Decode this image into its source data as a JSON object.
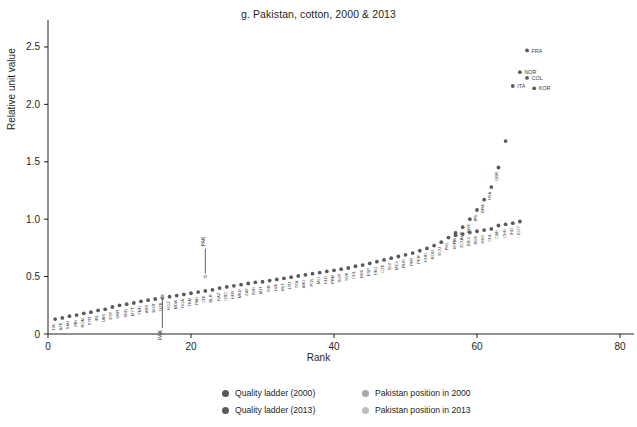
{
  "chart_data": {
    "type": "scatter",
    "title": "g. Pakistan, cotton,  2000 & 2013",
    "xlabel": "Rank",
    "ylabel": "Relative unit value",
    "xlim": [
      0,
      80
    ],
    "ylim": [
      0,
      2.7
    ],
    "xticks": [
      "0",
      "20",
      "40",
      "60",
      "80"
    ],
    "xtick_values": [
      0,
      20,
      40,
      60,
      80
    ],
    "yticks": [
      "0",
      "0.5",
      "1.0",
      "1.5",
      "2.0",
      "2.5"
    ],
    "ytick_values": [
      0,
      0.5,
      1.0,
      1.5,
      2.0,
      2.5
    ],
    "grid": false,
    "legend_position": "bottom-center",
    "series": [
      {
        "name": "Quality ladder (2000)",
        "color": "#5a5a5a",
        "points": [
          {
            "rank": 1,
            "value": 0.13,
            "label": "TJK"
          },
          {
            "rank": 2,
            "value": 0.14,
            "label": "AZE"
          },
          {
            "rank": 3,
            "value": 0.155,
            "label": "SAU"
          },
          {
            "rank": 4,
            "value": 0.165,
            "label": "IRN"
          },
          {
            "rank": 5,
            "value": 0.18,
            "label": "ROM"
          },
          {
            "rank": 6,
            "value": 0.19,
            "label": "SYR"
          },
          {
            "rank": 7,
            "value": 0.205,
            "label": "IRL"
          },
          {
            "rank": 8,
            "value": 0.215,
            "label": "UAS"
          },
          {
            "rank": 9,
            "value": 0.235,
            "label": "EST"
          },
          {
            "rank": 10,
            "value": 0.25,
            "label": "UKR"
          },
          {
            "rank": 11,
            "value": 0.26,
            "label": "SDN"
          },
          {
            "rank": 12,
            "value": 0.27,
            "label": "MYT"
          },
          {
            "rank": 13,
            "value": 0.285,
            "label": "YMN"
          },
          {
            "rank": 14,
            "value": 0.295,
            "label": "ARS"
          },
          {
            "rank": 15,
            "value": 0.305,
            "label": "BGR"
          },
          {
            "rank": 16,
            "value": 0.315,
            "label": "UZB"
          },
          {
            "rank": 17,
            "value": 0.325,
            "label": "KGZ"
          },
          {
            "rank": 18,
            "value": 0.335,
            "label": "MDA"
          },
          {
            "rank": 19,
            "value": 0.345,
            "label": "NGA"
          },
          {
            "rank": 20,
            "value": 0.355,
            "label": "TKM"
          },
          {
            "rank": 21,
            "value": 0.365,
            "label": "PAN"
          },
          {
            "rank": 22,
            "value": 0.375,
            "label": "CRI"
          },
          {
            "rank": 23,
            "value": 0.385,
            "label": "BLR"
          },
          {
            "rank": 24,
            "value": 0.4,
            "label": "KAZ"
          },
          {
            "rank": 25,
            "value": 0.41,
            "label": "GRC"
          },
          {
            "rank": 26,
            "value": 0.42,
            "label": "HRV"
          },
          {
            "rank": 27,
            "value": 0.43,
            "label": "MKD"
          },
          {
            "rank": 28,
            "value": 0.44,
            "label": "ZAF"
          },
          {
            "rank": 29,
            "value": 0.45,
            "label": "SVN"
          },
          {
            "rank": 30,
            "value": 0.455,
            "label": "AUT"
          },
          {
            "rank": 31,
            "value": 0.465,
            "label": "ISR"
          },
          {
            "rank": 32,
            "value": 0.475,
            "label": "LVA"
          },
          {
            "rank": 33,
            "value": 0.485,
            "label": "MLT"
          },
          {
            "rank": 34,
            "value": 0.495,
            "label": "LTU"
          },
          {
            "rank": 35,
            "value": 0.505,
            "label": "TZA"
          },
          {
            "rank": 36,
            "value": 0.515,
            "label": "ARG"
          },
          {
            "rank": 37,
            "value": 0.525,
            "label": "POL"
          },
          {
            "rank": 38,
            "value": 0.535,
            "label": "MLI"
          },
          {
            "rank": 39,
            "value": 0.545,
            "label": "NLD"
          },
          {
            "rank": 40,
            "value": 0.555,
            "label": "PRM"
          },
          {
            "rank": 41,
            "value": 0.565,
            "label": "SGP"
          },
          {
            "rank": 42,
            "value": 0.575,
            "label": "SVK"
          },
          {
            "rank": 43,
            "value": 0.59,
            "label": "CHL"
          },
          {
            "rank": 44,
            "value": 0.6,
            "label": "DNK"
          },
          {
            "rank": 45,
            "value": 0.615,
            "label": "ESP"
          },
          {
            "rank": 46,
            "value": 0.63,
            "label": "HKG"
          },
          {
            "rank": 47,
            "value": 0.645,
            "label": "CZE"
          },
          {
            "rank": 48,
            "value": 0.66,
            "label": "SLV"
          },
          {
            "rank": 49,
            "value": 0.675,
            "label": "MEX"
          },
          {
            "rank": 50,
            "value": 0.69,
            "label": "RUS"
          },
          {
            "rank": 51,
            "value": 0.705,
            "label": "PRT"
          },
          {
            "rank": 52,
            "value": 0.725,
            "label": "PER"
          },
          {
            "rank": 53,
            "value": 0.745,
            "label": "HUN"
          },
          {
            "rank": 54,
            "value": 0.77,
            "label": "ROU"
          },
          {
            "rank": 55,
            "value": 0.8,
            "label": "ECU"
          },
          {
            "rank": 56,
            "value": 0.84,
            "label": "PHL"
          },
          {
            "rank": 57,
            "value": 0.88,
            "label": "FIN"
          },
          {
            "rank": 58,
            "value": 0.93,
            "label": "AUT"
          },
          {
            "rank": 59,
            "value": 1.0,
            "label": "SWE"
          },
          {
            "rank": 60,
            "value": 1.08,
            "label": "JPN"
          },
          {
            "rank": 61,
            "value": 1.17,
            "label": "BRA"
          },
          {
            "rank": 62,
            "value": 1.28,
            "label": "USA"
          },
          {
            "rank": 63,
            "value": 1.45,
            "label": "GBR"
          },
          {
            "rank": 64,
            "value": 1.68,
            "label": ""
          },
          {
            "rank": 65,
            "value": 2.16,
            "label": "ITA"
          },
          {
            "rank": 66,
            "value": 2.28,
            "label": "NOR"
          },
          {
            "rank": 67,
            "value": 2.47,
            "label": "FRA"
          }
        ]
      },
      {
        "name": "Quality ladder (2013)",
        "color": "#5a5a5a",
        "points": [
          {
            "rank": 57,
            "value": 0.86,
            "label": "MYS"
          },
          {
            "rank": 58,
            "value": 0.87,
            "label": "ECU"
          },
          {
            "rank": 59,
            "value": 0.885,
            "label": "MEX"
          },
          {
            "rank": 60,
            "value": 0.895,
            "label": "RUS"
          },
          {
            "rank": 61,
            "value": 0.905,
            "label": "HKG"
          },
          {
            "rank": 62,
            "value": 0.915,
            "label": "CHL"
          },
          {
            "rank": 63,
            "value": 0.945,
            "label": "CAN"
          },
          {
            "rank": 64,
            "value": 0.955,
            "label": "CHN"
          },
          {
            "rank": 65,
            "value": 0.965,
            "label": "IND"
          },
          {
            "rank": 66,
            "value": 0.98,
            "label": "EGY"
          },
          {
            "rank": 67,
            "value": 2.23,
            "label": "COL"
          },
          {
            "rank": 68,
            "value": 2.14,
            "label": "KOR"
          }
        ]
      },
      {
        "name": "Pakistan position in 2000",
        "color": "#a8a8a8",
        "points": [
          {
            "rank": 16,
            "value": 0.33,
            "label": "PAK"
          }
        ]
      },
      {
        "name": "Pakistan position in 2013",
        "color": "#bdbdbd",
        "points": [
          {
            "rank": 22,
            "value": 0.5,
            "label": "PAK"
          }
        ]
      }
    ],
    "annotations": [
      {
        "text": "PAK",
        "rank": 16,
        "value": 0.33,
        "leader": "down"
      },
      {
        "text": "PAK",
        "rank": 22,
        "value": 0.5,
        "leader": "up"
      }
    ],
    "callout_labels": [
      {
        "text": "ITA",
        "rank": 65,
        "value": 2.16
      },
      {
        "text": "NOR",
        "rank": 66,
        "value": 2.28
      },
      {
        "text": "FRA",
        "rank": 67,
        "value": 2.47
      },
      {
        "text": "COL",
        "rank": 67,
        "value": 2.23
      },
      {
        "text": "KOR",
        "rank": 68,
        "value": 2.14
      }
    ]
  },
  "legend": {
    "items": [
      {
        "label": "Quality ladder (2000)",
        "color": "#5a5a5a"
      },
      {
        "label": "Pakistan position in 2000",
        "color": "#a8a8a8"
      },
      {
        "label": "Quality ladder (2013)",
        "color": "#5a5a5a"
      },
      {
        "label": "Pakistan position in 2013",
        "color": "#bdbdbd"
      }
    ]
  }
}
